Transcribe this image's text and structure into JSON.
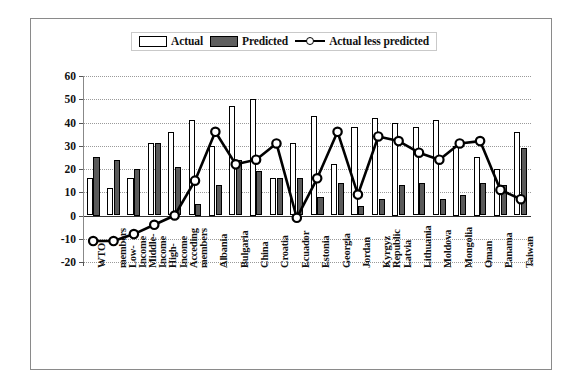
{
  "legend": {
    "items": [
      {
        "label": "Actual",
        "type": "bar-open",
        "color": "#ffffff"
      },
      {
        "label": "Predicted",
        "type": "bar-filled",
        "color": "#5a5a5a"
      },
      {
        "label": "Actual less predicted",
        "type": "line-marker",
        "color": "#000000"
      }
    ]
  },
  "axis": {
    "y_ticks": [
      "60",
      "50",
      "40",
      "30",
      "20",
      "10",
      "0",
      "-10",
      "-20"
    ]
  },
  "chart_data": {
    "type": "bar",
    "title": "",
    "subtitle": "",
    "xlabel": "",
    "ylabel": "",
    "ylim": [
      -20,
      60
    ],
    "ytick_values": [
      60,
      50,
      40,
      30,
      20,
      10,
      0,
      -10,
      -20
    ],
    "grid": true,
    "legend_position": "top-center",
    "categories": [
      "WTO members",
      "Low-Income",
      "Middle-Income",
      "Income High-",
      "Income Acceding",
      "members",
      "Albania",
      "Bulgaria",
      "China",
      "Croatia",
      "Ecuador",
      "Estonia",
      "Georgia",
      "Jordan",
      "Kyrgyz Republic",
      "Latvia",
      "Lithuania",
      "Moldova",
      "Mongolia",
      "Oman",
      "Panama",
      "Taiwan"
    ],
    "category_lines": [
      [
        "WTO"
      ],
      [
        "members",
        "Low-"
      ],
      [
        "Income",
        "Middle-"
      ],
      [
        "Income",
        "High-"
      ],
      [
        "Income",
        "Acceding"
      ],
      [
        "members"
      ],
      [
        "Albania"
      ],
      [
        "Bulgaria"
      ],
      [
        "China"
      ],
      [
        "Croatia"
      ],
      [
        "Ecuador"
      ],
      [
        "Estonia"
      ],
      [
        "Georgia"
      ],
      [
        "Jordan"
      ],
      [
        "Kyrgyz",
        "Republic"
      ],
      [
        "Latvia"
      ],
      [
        "Lithuania"
      ],
      [
        "Moldova"
      ],
      [
        "Mongolia"
      ],
      [
        "Oman"
      ],
      [
        "Panama"
      ],
      [
        "Taiwan"
      ]
    ],
    "series": [
      {
        "name": "Actual",
        "type": "bar",
        "values": [
          16,
          12,
          16,
          31,
          36,
          41,
          30,
          47,
          50,
          16,
          31,
          43,
          22,
          38,
          42,
          40,
          38,
          41,
          30,
          25,
          20,
          36
        ]
      },
      {
        "name": "Predicted",
        "type": "bar",
        "values": [
          25,
          24,
          20,
          31,
          21,
          5,
          13,
          24,
          19,
          16,
          16,
          8,
          14,
          4,
          7,
          13,
          14,
          7,
          9,
          14,
          13,
          29
        ]
      },
      {
        "name": "Actual less predicted",
        "type": "line",
        "values": [
          -11,
          -11,
          -8,
          -4,
          0,
          15,
          36,
          22,
          24,
          31,
          -1,
          16,
          36,
          9,
          34,
          32,
          27,
          24,
          31,
          32,
          11,
          7
        ]
      }
    ]
  }
}
